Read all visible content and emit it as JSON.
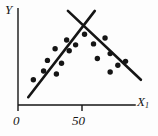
{
  "figure": {
    "background": "#fdfdfd",
    "ink_color": "#151515"
  },
  "chart_data": {
    "type": "scatter",
    "xlabel_base": "X",
    "xlabel_sub": "1",
    "ylabel": "Y",
    "grid": false,
    "legend": false,
    "xlim": [
      0,
      92
    ],
    "ylim": [
      0,
      100
    ],
    "x_ticks": [
      {
        "value": 0,
        "label": "0"
      },
      {
        "value": 50,
        "label": "50"
      }
    ],
    "points": [
      [
        12,
        26
      ],
      [
        20,
        35
      ],
      [
        30,
        32
      ],
      [
        23,
        46
      ],
      [
        34,
        43
      ],
      [
        29,
        58
      ],
      [
        40,
        56
      ],
      [
        38,
        67
      ],
      [
        45,
        62
      ],
      [
        52,
        73
      ],
      [
        59,
        63
      ],
      [
        68,
        69
      ],
      [
        62,
        48
      ],
      [
        72,
        53
      ],
      [
        72,
        34
      ],
      [
        78,
        41
      ],
      [
        84,
        45
      ]
    ],
    "series": [
      {
        "name": "ascending-fit-line",
        "type": "line",
        "x": [
          8,
          60
        ],
        "y": [
          8,
          97
        ]
      },
      {
        "name": "descending-fit-line",
        "type": "line",
        "x": [
          39,
          96
        ],
        "y": [
          97,
          26
        ]
      }
    ]
  }
}
